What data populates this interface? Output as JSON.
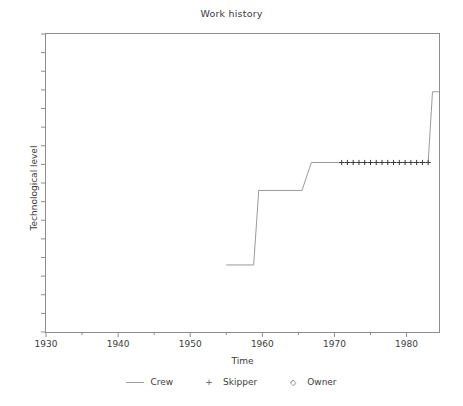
{
  "chart_data": {
    "type": "line",
    "title": "Work history",
    "xlabel": "Time",
    "ylabel": "Technological level",
    "xlim": [
      1930,
      1984.5
    ],
    "ylim": [
      0,
      16
    ],
    "grid": false,
    "xticks": [
      1930,
      1940,
      1950,
      1960,
      1970,
      1980
    ],
    "xticklabels": [
      "1930",
      "1940",
      "1950",
      "1960",
      "1970",
      "1980"
    ],
    "xminorticks": [
      1935,
      1945,
      1955,
      1965,
      1975
    ],
    "yticks": [
      0,
      1,
      2,
      3,
      4,
      5,
      6,
      7,
      8,
      9,
      10,
      11,
      12,
      13,
      14,
      15,
      16
    ],
    "yticklabels": [],
    "legend_position": "bottom",
    "legend": [
      {
        "label": "Crew",
        "marker": "line",
        "glyph": "—"
      },
      {
        "label": "Skipper",
        "marker": "plus",
        "glyph": "+"
      },
      {
        "label": "Owner",
        "marker": "diamond",
        "glyph": "◇"
      }
    ],
    "series": [
      {
        "name": "Crew",
        "type": "step",
        "color": "#9a9a9a",
        "points": [
          {
            "x": 1955.0,
            "y": 3.6
          },
          {
            "x": 1958.8,
            "y": 3.6
          },
          {
            "x": 1959.5,
            "y": 7.6
          },
          {
            "x": 1965.5,
            "y": 7.6
          },
          {
            "x": 1966.8,
            "y": 9.1
          },
          {
            "x": 1983.0,
            "y": 9.1
          },
          {
            "x": 1983.6,
            "y": 12.9
          },
          {
            "x": 1984.5,
            "y": 12.9
          }
        ]
      },
      {
        "name": "Skipper",
        "type": "scatter",
        "marker": "plus",
        "color": "#3a3a3a",
        "y": 9.1,
        "x": [
          1971.0,
          1971.8,
          1972.6,
          1973.4,
          1974.2,
          1975.0,
          1975.8,
          1976.6,
          1977.4,
          1978.2,
          1979.0,
          1979.8,
          1980.6,
          1981.4,
          1982.2,
          1983.0
        ]
      },
      {
        "name": "Owner",
        "type": "scatter",
        "marker": "diamond",
        "color": "#3a3a3a",
        "x": [],
        "y": []
      }
    ]
  },
  "chart": {
    "title": "Work history",
    "xlabel": "Time",
    "ylabel": "Technological level"
  }
}
